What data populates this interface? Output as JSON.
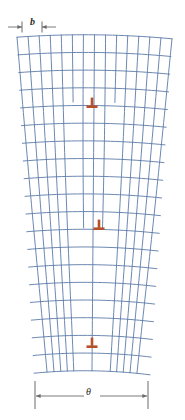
{
  "figure": {
    "type": "tilt-grain-boundary-lattice",
    "background": "#ffffff",
    "width": 185,
    "height": 420
  },
  "labels": {
    "burgers_vector": "b",
    "tilt_angle": "θ"
  },
  "dimensions": {
    "burgers": {
      "label": "b",
      "y": 27,
      "x_start": 8,
      "x_inner_left": 22,
      "x_inner_right": 42,
      "x_end": 56,
      "arrow_direction": "inward"
    },
    "tilt": {
      "label": "θ",
      "y": 396,
      "x_start": 35,
      "x_end": 148,
      "extension_top": 381,
      "extension_bottom": 409,
      "arrow_direction": "outward"
    }
  },
  "lattice": {
    "line_color": "#5b7ba8",
    "line_width": 0.9,
    "top_y": 38,
    "bottom_y": 374,
    "top_left_x": 17,
    "top_right_x": 172,
    "bottom_left_x": 34,
    "bottom_right_x": 150,
    "rows": 19,
    "columns_top": 14,
    "columns_bottom": 10
  },
  "dislocations": {
    "symbol": "⊥",
    "color": "#b5502a",
    "count": 3,
    "items": [
      {
        "name": "edge-dislocation-top",
        "x": 92,
        "y": 103
      },
      {
        "name": "edge-dislocation-middle",
        "x": 99,
        "y": 225
      },
      {
        "name": "edge-dislocation-bottom",
        "x": 92,
        "y": 343
      }
    ]
  },
  "colors": {
    "lattice": "#5b7ba8",
    "dislocation": "#b5502a",
    "dimension": "#6b6b6b",
    "text": "#2a2a2a"
  }
}
